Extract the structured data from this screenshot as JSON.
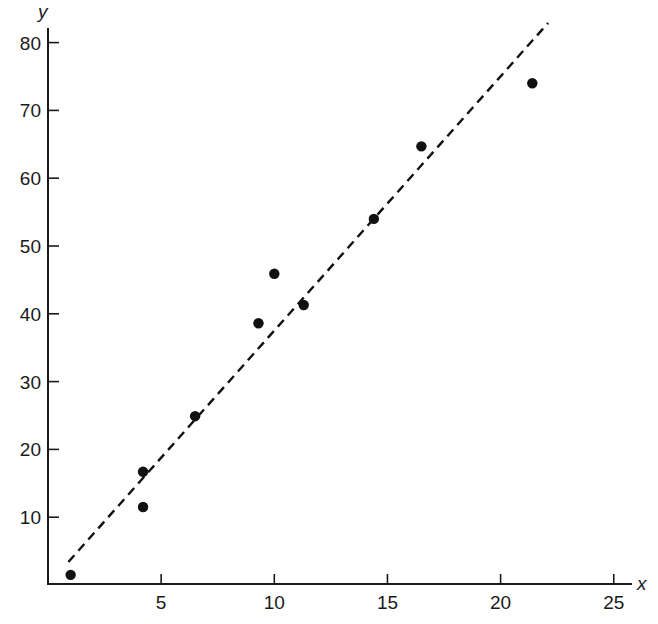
{
  "chart_data": {
    "type": "scatter",
    "title": "",
    "xlabel": "x",
    "ylabel": "y",
    "xlim": [
      0,
      26
    ],
    "ylim": [
      0,
      82
    ],
    "grid": false,
    "legend": null,
    "x_ticks": [
      5,
      10,
      15,
      20,
      25
    ],
    "y_ticks": [
      10,
      20,
      30,
      40,
      50,
      60,
      70,
      80
    ],
    "series": [
      {
        "name": "observations",
        "marker": "filled-circle",
        "color": "#111111",
        "points": [
          {
            "x": 1.0,
            "y": 1.5
          },
          {
            "x": 4.2,
            "y": 16.7
          },
          {
            "x": 4.2,
            "y": 11.5
          },
          {
            "x": 6.5,
            "y": 24.9
          },
          {
            "x": 9.3,
            "y": 38.6
          },
          {
            "x": 10.0,
            "y": 45.9
          },
          {
            "x": 11.3,
            "y": 41.3
          },
          {
            "x": 14.4,
            "y": 54.0
          },
          {
            "x": 16.5,
            "y": 64.7
          },
          {
            "x": 21.4,
            "y": 74.0
          }
        ]
      }
    ],
    "fit_line": {
      "name": "fitted regression line",
      "style": "dashed",
      "color": "#111111",
      "x": [
        0.9,
        22.1
      ],
      "y": [
        3.4,
        82.9
      ]
    }
  },
  "axes": {
    "x_letter": "x",
    "y_letter": "y",
    "x_tick_labels": [
      "5",
      "10",
      "15",
      "20",
      "25"
    ],
    "y_tick_labels": [
      "10",
      "20",
      "30",
      "40",
      "50",
      "60",
      "70",
      "80"
    ]
  }
}
